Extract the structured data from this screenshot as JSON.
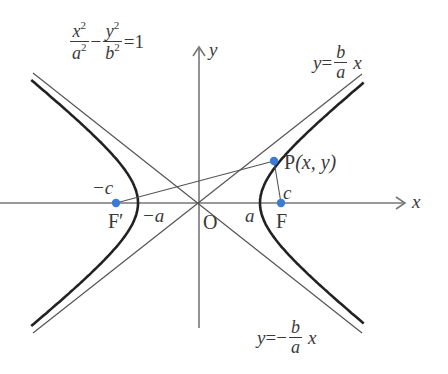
{
  "diagram": {
    "type": "hyperbola",
    "equation": {
      "x_num": "x",
      "x_den": "a",
      "y_num": "y",
      "y_den": "b",
      "exp": "2",
      "minus": "−",
      "equals": "=",
      "rhs": "1"
    },
    "asymptote_pos": {
      "lhs": "y",
      "eq": "=",
      "num": "b",
      "den": "a",
      "var": "x"
    },
    "asymptote_neg": {
      "lhs": "y",
      "eq": "=",
      "sign": "−",
      "num": "b",
      "den": "a",
      "var": "x"
    },
    "axes": {
      "x_label": "x",
      "y_label": "y",
      "origin_label": "O"
    },
    "points": {
      "focus_right": {
        "label": "F",
        "coord_label": "c"
      },
      "focus_left": {
        "label": "F′",
        "coord_label": "−c"
      },
      "vertex_right": {
        "label": "a"
      },
      "vertex_left": {
        "label": "−a"
      },
      "point_p": {
        "label": "P",
        "coords": "(x, y)"
      }
    },
    "colors": {
      "curve": "#222222",
      "line": "#555555",
      "axis": "#777777",
      "point": "#3a7bd5",
      "text": "#3a3a3a"
    }
  }
}
